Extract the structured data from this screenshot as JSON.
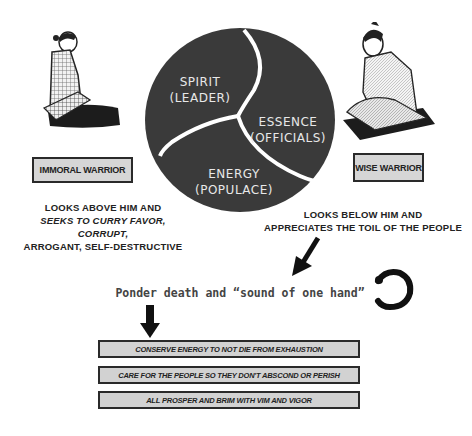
{
  "diagram": {
    "circle": {
      "segments": [
        {
          "title": "SPIRIT",
          "subtitle": "(LEADER)"
        },
        {
          "title": "ESSENCE",
          "subtitle": "(OFFICIALS)"
        },
        {
          "title": "ENERGY",
          "subtitle": "(POPULACE)"
        }
      ],
      "fill_color": "#3a3a3a",
      "divider_color": "#ffffff"
    },
    "left_figure": {
      "label": "IMMORAL WARRIOR",
      "caption_lines": [
        "LOOKS ABOVE HIM AND",
        "SEEKS TO CURRY FAVOR, CORRUPT,",
        "ARROGANT, SELF-DESTRUCTIVE"
      ]
    },
    "right_figure": {
      "label": "WISE WARRIOR",
      "caption_lines": [
        "LOOKS BELOW HIM AND",
        "APPRECIATES THE TOIL OF THE PEOPLE"
      ]
    },
    "ponder_text": "Ponder death and “sound of one hand”",
    "icons": [
      "samurai-figure-icon",
      "samurai-figure-icon",
      "arrow-down-left-icon",
      "arrow-down-icon",
      "enso-circle-icon"
    ],
    "steps": [
      "CONSERVE ENERGY TO NOT DIE FROM EXHAUSTION",
      "CARE FOR THE PEOPLE SO THEY DON'T ABSCOND OR PERISH",
      "ALL PROSPER AND BRIM WITH VIM AND VIGOR"
    ],
    "box_fill": "#d4d4d4",
    "text_color": "#222222"
  }
}
